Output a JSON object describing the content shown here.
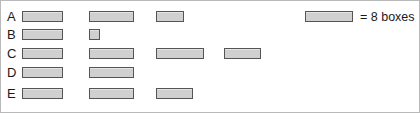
{
  "chart_data": {
    "type": "bar",
    "title": "",
    "xlabel": "",
    "ylabel": "",
    "grid": false,
    "orientation": "horizontal",
    "unit_symbol_label": "= 8 boxes",
    "unit_value": 8,
    "unit_name": "boxes",
    "legend_position": "top-right",
    "bar_fill_color": "#d0d0d0",
    "bar_border_color": "#555555",
    "background_color": "#ffffff",
    "categories": [
      "A",
      "B",
      "C",
      "D",
      "E"
    ],
    "symbols_per_row": [
      2.625,
      1.25,
      3.8,
      2.0,
      2.8
    ],
    "values": [
      21,
      10,
      30.4,
      16,
      22.4
    ],
    "rows": [
      {
        "label": "A",
        "symbols": [
          {
            "left": 21,
            "width": 41,
            "fraction": 1.0
          },
          {
            "left": 88,
            "width": 45,
            "fraction": 1.0
          },
          {
            "left": 155,
            "width": 28,
            "fraction": 0.625
          }
        ]
      },
      {
        "label": "B",
        "symbols": [
          {
            "left": 21,
            "width": 41,
            "fraction": 1.0
          },
          {
            "left": 88,
            "width": 11,
            "fraction": 0.25
          }
        ]
      },
      {
        "label": "C",
        "symbols": [
          {
            "left": 21,
            "width": 41,
            "fraction": 1.0
          },
          {
            "left": 88,
            "width": 45,
            "fraction": 1.0
          },
          {
            "left": 155,
            "width": 48,
            "fraction": 1.0
          },
          {
            "left": 223,
            "width": 37,
            "fraction": 0.8
          }
        ]
      },
      {
        "label": "D",
        "symbols": [
          {
            "left": 21,
            "width": 41,
            "fraction": 1.0
          },
          {
            "left": 88,
            "width": 45,
            "fraction": 1.0
          }
        ]
      },
      {
        "label": "E",
        "symbols": [
          {
            "left": 21,
            "width": 41,
            "fraction": 1.0
          },
          {
            "left": 88,
            "width": 45,
            "fraction": 1.0
          },
          {
            "left": 155,
            "width": 37,
            "fraction": 0.8
          }
        ]
      }
    ]
  },
  "legend": {
    "text": "= 8 boxes"
  },
  "layout": {
    "row_tops": [
      8,
      26,
      45,
      64,
      85
    ]
  }
}
